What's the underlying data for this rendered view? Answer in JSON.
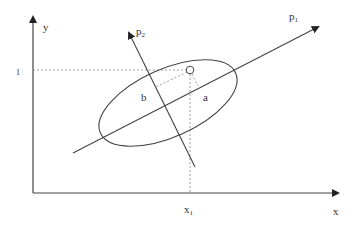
{
  "diagram": {
    "title": "",
    "axes": {
      "x_label": "x",
      "y_label": "y",
      "x_tick": "x",
      "x_tick_sub": "1",
      "y_tick": "1"
    },
    "principal_axes": {
      "p1": {
        "label": "p",
        "sub": "1"
      },
      "p2": {
        "label": "p",
        "sub": "2"
      }
    },
    "distances": {
      "a": "a",
      "b": "b"
    },
    "colors": {
      "line": "#333333",
      "dashed": "#888888",
      "background": "#ffffff"
    }
  }
}
